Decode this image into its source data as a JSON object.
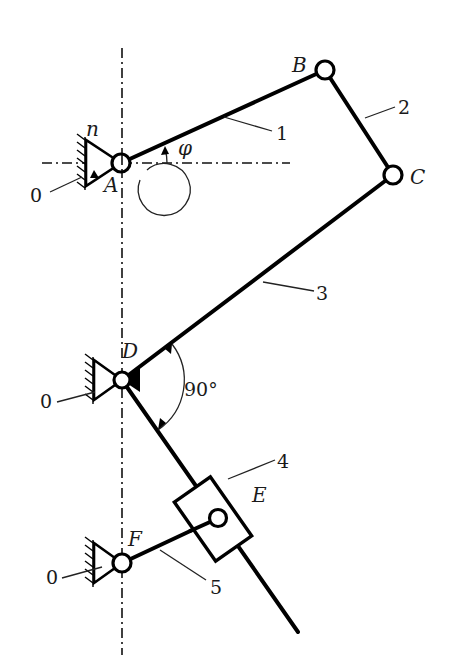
{
  "diagram": {
    "type": "planar-linkage-mechanism",
    "points": {
      "A": "A",
      "B": "B",
      "C": "C",
      "D": "D",
      "E": "E",
      "F": "F"
    },
    "links": {
      "l1": "1",
      "l2": "2",
      "l3": "3",
      "l4": "4",
      "l5": "5"
    },
    "ground_labels": {
      "gA": "0",
      "gD": "0",
      "gF": "0"
    },
    "angle_symbol": "φ",
    "speed_symbol": "n",
    "right_angle_label": "90°",
    "colors": {
      "line": "#000000",
      "background": "#ffffff"
    }
  }
}
